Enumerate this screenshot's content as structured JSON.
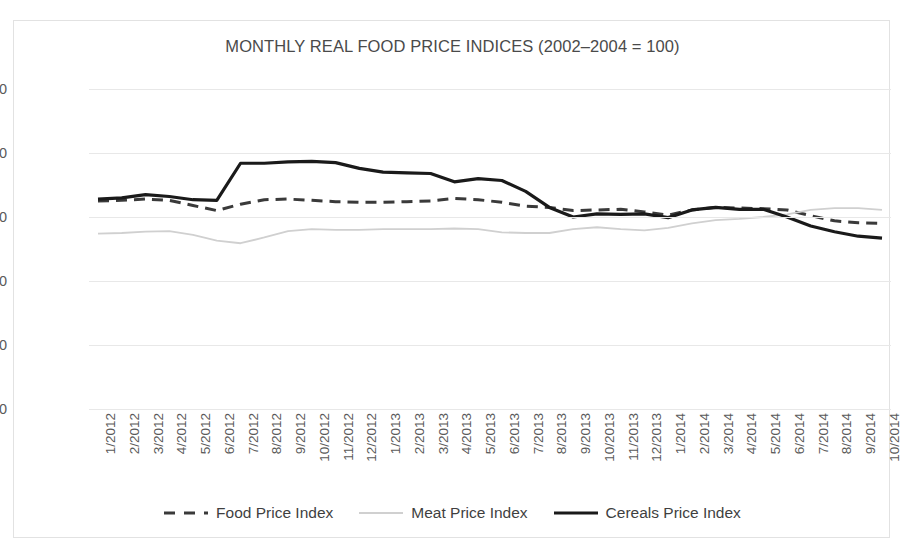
{
  "chart_data": {
    "type": "line",
    "title": "MONTHLY REAL FOOD PRICE INDICES (2002–2004 = 100)",
    "xlabel": "",
    "ylabel": "",
    "ylim": [
      0,
      250
    ],
    "yticks": [
      "0.0",
      "50.0",
      "100.0",
      "150.0",
      "200.0",
      "250.0"
    ],
    "ytick_values": [
      0,
      50,
      100,
      150,
      200,
      250
    ],
    "grid": true,
    "legend_position": "bottom",
    "categories": [
      "1/2012",
      "2/2012",
      "3/2012",
      "4/2012",
      "5/2012",
      "6/2012",
      "7/2012",
      "8/2012",
      "9/2012",
      "10/2012",
      "11/2012",
      "12/2012",
      "1/2013",
      "2/2013",
      "3/2013",
      "4/2013",
      "5/2013",
      "6/2013",
      "7/2013",
      "8/2013",
      "9/2013",
      "10/2013",
      "11/2013",
      "12/2013",
      "1/2014",
      "2/2014",
      "3/2014",
      "4/2014",
      "5/2014",
      "6/2014",
      "7/2014",
      "8/2014",
      "9/2014",
      "10/2014"
    ],
    "series": [
      {
        "name": "Food Price Index",
        "color": "#3a3a3a",
        "style": "dashed",
        "width": 3,
        "values": [
          162.5,
          163.0,
          164.0,
          163.0,
          159.0,
          155.0,
          160.0,
          163.5,
          164.0,
          163.0,
          162.0,
          161.5,
          161.5,
          162.0,
          162.5,
          164.5,
          163.5,
          161.5,
          158.5,
          157.5,
          155.0,
          155.5,
          156.0,
          154.0,
          151.5,
          155.5,
          157.5,
          157.0,
          156.5,
          155.5,
          151.0,
          147.0,
          145.5,
          145.0
        ]
      },
      {
        "name": "Meat Price Index",
        "color": "#d0d0d0",
        "style": "solid",
        "width": 1.8,
        "values": [
          137.0,
          137.5,
          138.5,
          139.0,
          136.0,
          131.5,
          129.5,
          134.0,
          139.0,
          140.5,
          140.0,
          140.0,
          140.5,
          140.5,
          140.5,
          141.0,
          140.5,
          138.0,
          137.5,
          137.5,
          140.5,
          142.0,
          140.5,
          139.5,
          141.5,
          145.0,
          147.5,
          148.5,
          150.0,
          152.0,
          155.5,
          157.0,
          157.0,
          155.5
        ]
      },
      {
        "name": "Cereals Price Index",
        "color": "#1a1a1a",
        "style": "solid",
        "width": 3.2,
        "values": [
          164.0,
          165.0,
          167.5,
          166.0,
          163.5,
          163.0,
          192.0,
          192.0,
          193.0,
          193.5,
          192.5,
          188.0,
          185.0,
          184.5,
          184.0,
          177.5,
          180.0,
          178.5,
          170.0,
          157.5,
          150.0,
          152.5,
          152.0,
          152.5,
          149.5,
          155.5,
          157.5,
          156.0,
          156.0,
          150.0,
          143.0,
          138.5,
          135.0,
          133.5
        ]
      }
    ]
  },
  "legend": {
    "items": [
      {
        "label": "Food Price Index"
      },
      {
        "label": "Meat Price Index"
      },
      {
        "label": "Cereals Price Index"
      }
    ]
  }
}
